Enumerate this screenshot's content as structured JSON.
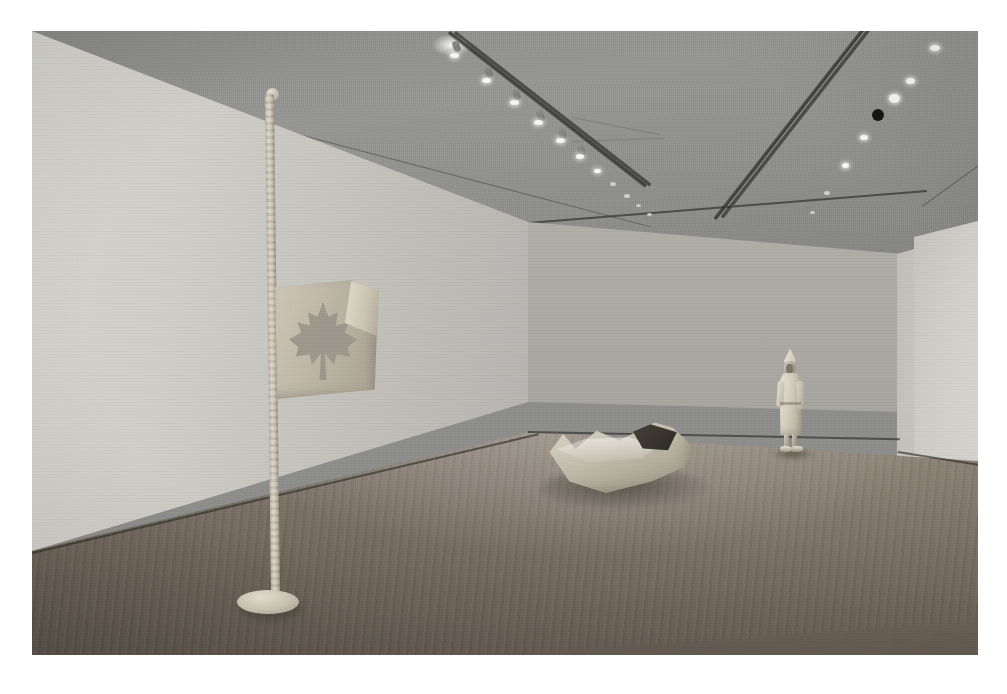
{
  "image": {
    "kind": "photograph",
    "title": "Gallery installation view",
    "description": "Interior photograph of a museum gallery with pale walls, a wooden plank floor, and ceiling track lighting. Three pale sculptures are installed: a tall flagpole with a maple-leaf flag at left, a boat-like hollow form on the floor at centre, and a standing coated figure against the back-right wall.",
    "orientation": "landscape",
    "palette": "monochrome-warm-grey",
    "border_color": "#ffffff",
    "plate_width": 946,
    "plate_height": 624
  },
  "room": {
    "ceiling_label": "Gallery ceiling",
    "wall_left_label": "Left gallery wall",
    "wall_back_label": "Back gallery wall",
    "wall_right_label": "Right gallery wall",
    "alcove_label": "Recessed doorway",
    "floor_label": "Wooden plank floor",
    "baseboard_label": "Baseboard trim"
  },
  "lighting": {
    "track_label": "Ceiling track lighting rail",
    "lamp_label": "Track spotlight",
    "dark_fixture_label": "Dark ceiling fixture",
    "glare_label": "Lens flare highlight",
    "left_track_lamp_count": 11,
    "right_track_lamp_count": 7,
    "dark_fixture_count": 1
  },
  "artworks": [
    {
      "id": "flagpole",
      "name": "Flagpole with maple-leaf flag",
      "position": "left foreground",
      "parts": [
        "pole",
        "finial cap",
        "base plate",
        "flag panel",
        "folded corner",
        "maple leaf cut-out"
      ],
      "material_look": "pale cast plaster / bronze"
    },
    {
      "id": "boat",
      "name": "Hollow boat form",
      "position": "centre floor",
      "parts": [
        "hull",
        "hollow interior",
        "rim"
      ],
      "material_look": "pale cast plaster"
    },
    {
      "id": "figure",
      "name": "Standing figure in long coat",
      "position": "back right, against wall",
      "parts": [
        "pointed cap",
        "head",
        "coat",
        "arms",
        "legs",
        "shoes"
      ],
      "material_look": "pale cast plaster"
    }
  ],
  "colors": {
    "wall_light": "#d6d5d0",
    "wall_mid": "#b0afaa",
    "ceiling": "#8e8e8c",
    "floor_near": "#5a5249",
    "floor_far": "#9a9186",
    "sculpture": "#cdc6b5",
    "track": "#3f3f3d",
    "lamp": "#f6f5ef"
  }
}
